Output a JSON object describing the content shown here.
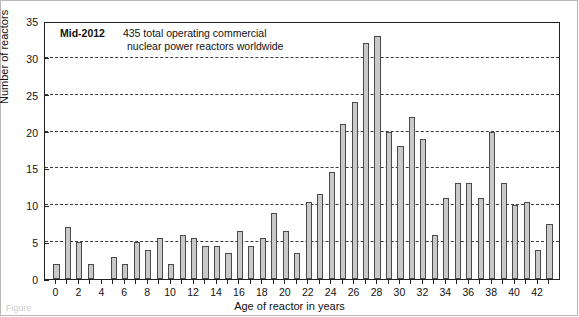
{
  "figure": {
    "annotation_label": "Mid-2012",
    "annotation_line1": "435 total operating commercial",
    "annotation_line2": "nuclear power reactors worldwide",
    "caption_partial": "Figure"
  },
  "colors": {
    "bar_fill": "#c9c9c9",
    "bar_stroke": "#4a4a4a",
    "axis": "#222222",
    "grid": "#3b3b3b",
    "background": "#ffffff"
  },
  "chart_data": {
    "type": "bar",
    "title": "",
    "xlabel": "Age of reactor in years",
    "ylabel": "Number of reactors",
    "xlim": [
      -1,
      44
    ],
    "ylim": [
      0,
      35
    ],
    "grid": true,
    "legend": "none",
    "yticks": [
      0,
      5,
      10,
      15,
      20,
      25,
      30,
      35
    ],
    "xticks": [
      0,
      2,
      4,
      6,
      8,
      10,
      12,
      14,
      16,
      18,
      20,
      22,
      24,
      26,
      28,
      30,
      32,
      34,
      36,
      38,
      40,
      42
    ],
    "categories": [
      0,
      1,
      2,
      3,
      4,
      5,
      6,
      7,
      8,
      9,
      10,
      11,
      12,
      13,
      14,
      15,
      16,
      17,
      18,
      19,
      20,
      21,
      22,
      23,
      24,
      25,
      26,
      27,
      28,
      29,
      30,
      31,
      32,
      33,
      34,
      35,
      36,
      37,
      38,
      39,
      40,
      41,
      42,
      43
    ],
    "values": [
      2,
      7,
      5,
      2,
      0,
      3,
      2,
      2,
      2,
      2,
      3,
      2,
      2,
      2,
      2,
      2,
      2,
      2,
      2,
      2,
      2,
      2,
      2,
      2,
      2,
      2,
      2,
      2,
      2,
      2,
      2,
      2,
      2,
      2,
      2,
      2,
      2,
      2,
      2,
      2,
      2,
      2,
      2,
      2
    ]
  }
}
